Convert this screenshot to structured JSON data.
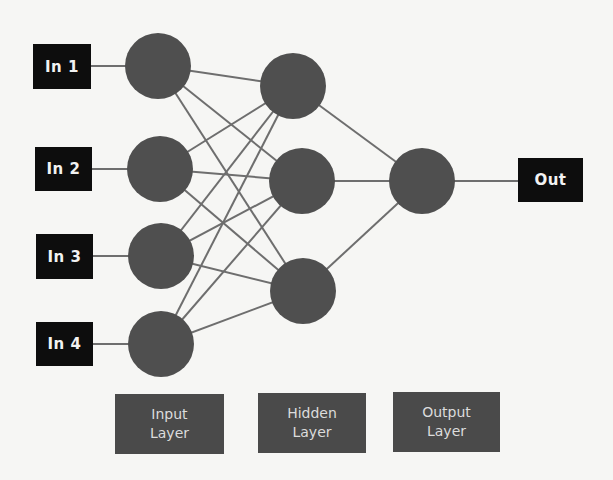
{
  "diagram": {
    "type": "neural-network",
    "inputs": [
      {
        "label": "In 1"
      },
      {
        "label": "In 2"
      },
      {
        "label": "In 3"
      },
      {
        "label": "In 4"
      }
    ],
    "output": {
      "label": "Out"
    },
    "layers": [
      {
        "line1": "Input",
        "line2": "Layer",
        "node_count": 4
      },
      {
        "line1": "Hidden",
        "line2": "Layer",
        "node_count": 3
      },
      {
        "line1": "Output",
        "line2": "Layer",
        "node_count": 1
      }
    ],
    "colors": {
      "node": "#4f4f4f",
      "edge": "#6e6e6e",
      "io_box": "#0d0d0d",
      "layer_box": "#4a4a4a",
      "background": "#f6f6f4"
    },
    "connectivity": "fully-connected"
  }
}
